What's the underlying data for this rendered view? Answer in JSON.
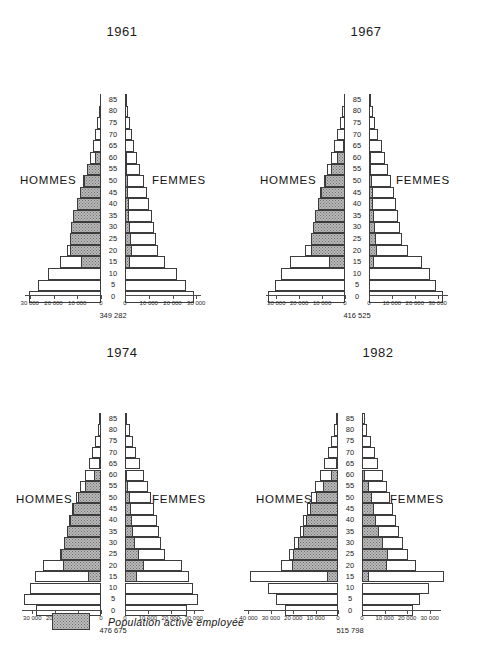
{
  "legend": {
    "label": "Population active employée",
    "swatch_name": "active-population-swatch",
    "fill_color": "#bdbdbd"
  },
  "labels": {
    "men": "HOMMES",
    "women": "FEMMES"
  },
  "age_ticks": [
    "0",
    "5",
    "10",
    "15",
    "20",
    "25",
    "30",
    "35",
    "40",
    "45",
    "50",
    "55",
    "60",
    "65",
    "70",
    "75",
    "80",
    "85"
  ],
  "chart_data": [
    {
      "type": "bar",
      "id": "pyramid-1961",
      "title": "1961",
      "total": "349 282",
      "xlabel": "",
      "ylabel": "",
      "orientation": "population-pyramid",
      "left_series_name": "HOMMES",
      "right_series_name": "FEMMES",
      "xlim": [
        0,
        32000
      ],
      "left_tick_labels": [
        "30 000",
        "20 000",
        "10 000",
        "0"
      ],
      "left_tick_values": [
        30000,
        20000,
        10000,
        0
      ],
      "right_tick_labels": [
        "0",
        "10 000",
        "20 000",
        "30 000"
      ],
      "right_tick_values": [
        0,
        10000,
        20000,
        30000
      ],
      "age_groups": [
        "0-4",
        "5-9",
        "10-14",
        "15-19",
        "20-24",
        "25-29",
        "30-34",
        "35-39",
        "40-44",
        "45-49",
        "50-54",
        "55-59",
        "60-64",
        "65-69",
        "70-74",
        "75-79",
        "80-84",
        "85+"
      ],
      "series": [
        {
          "name": "HOMMES total",
          "side": "left",
          "values": [
            30200,
            26500,
            22500,
            17300,
            14200,
            13200,
            12600,
            11700,
            10300,
            9000,
            7500,
            6100,
            4700,
            3500,
            2500,
            1600,
            900,
            400
          ]
        },
        {
          "name": "HOMMES active employée",
          "side": "left",
          "values": [
            0,
            0,
            0,
            8300,
            13000,
            13100,
            12500,
            11600,
            10200,
            8900,
            7300,
            5700,
            2500,
            600,
            0,
            0,
            0,
            0
          ]
        },
        {
          "name": "FEMMES total",
          "side": "right",
          "values": [
            29000,
            25800,
            21700,
            17000,
            14100,
            13000,
            12300,
            11400,
            10300,
            9100,
            7800,
            6500,
            5100,
            3900,
            2900,
            1900,
            1100,
            500
          ]
        },
        {
          "name": "FEMMES active employée",
          "side": "right",
          "values": [
            0,
            0,
            0,
            2100,
            2800,
            2600,
            2100,
            1800,
            1600,
            1400,
            1200,
            900,
            500,
            0,
            0,
            0,
            0,
            0
          ]
        }
      ]
    },
    {
      "type": "bar",
      "id": "pyramid-1967",
      "title": "1967",
      "total": "416 525",
      "xlabel": "",
      "ylabel": "",
      "orientation": "population-pyramid",
      "left_series_name": "HOMMES",
      "right_series_name": "FEMMES",
      "xlim": [
        0,
        34500
      ],
      "left_tick_labels": [
        "30 000",
        "20 000",
        "10 000",
        "0"
      ],
      "left_tick_values": [
        30000,
        20000,
        10000,
        0
      ],
      "right_tick_labels": [
        "0",
        "10 000",
        "20 000",
        "30 000"
      ],
      "right_tick_values": [
        0,
        10000,
        20000,
        30000
      ],
      "age_groups": [
        "0-4",
        "5-9",
        "10-14",
        "15-19",
        "20-24",
        "25-29",
        "30-34",
        "35-39",
        "40-44",
        "45-49",
        "50-54",
        "55-59",
        "60-64",
        "65-69",
        "70-74",
        "75-79",
        "80-84",
        "85+"
      ],
      "series": [
        {
          "name": "HOMMES total",
          "side": "left",
          "values": [
            33800,
            30500,
            28000,
            24000,
            17500,
            15000,
            14000,
            13000,
            12000,
            10700,
            9300,
            7800,
            6300,
            4800,
            3500,
            2300,
            1300,
            600
          ]
        },
        {
          "name": "HOMMES active employée",
          "side": "left",
          "values": [
            0,
            0,
            0,
            6800,
            14800,
            14800,
            13900,
            12900,
            11800,
            10400,
            8600,
            6300,
            3400,
            900,
            0,
            0,
            0,
            0
          ]
        },
        {
          "name": "FEMMES total",
          "side": "right",
          "values": [
            32200,
            29200,
            26800,
            23000,
            17200,
            14600,
            13600,
            12700,
            11900,
            10900,
            9700,
            8400,
            7000,
            5500,
            4100,
            2800,
            1700,
            800
          ]
        },
        {
          "name": "FEMMES active employée",
          "side": "right",
          "values": [
            0,
            0,
            0,
            2000,
            3300,
            3200,
            2700,
            2200,
            1900,
            1700,
            1400,
            1000,
            600,
            0,
            0,
            0,
            0,
            0
          ]
        }
      ]
    },
    {
      "type": "bar",
      "id": "pyramid-1974",
      "title": "1974",
      "total": "476 675",
      "xlabel": "",
      "ylabel": "",
      "orientation": "population-pyramid",
      "left_series_name": "HOMMES",
      "right_series_name": "FEMMES",
      "xlim": [
        0,
        34500
      ],
      "left_tick_labels": [
        "30 000",
        "20 000",
        "10 000",
        "0"
      ],
      "left_tick_values": [
        30000,
        20000,
        10000,
        0
      ],
      "right_tick_labels": [
        "0",
        "10 000",
        "20 000",
        "30 000"
      ],
      "right_tick_values": [
        0,
        10000,
        20000,
        30000
      ],
      "age_groups": [
        "0-4",
        "5-9",
        "10-14",
        "15-19",
        "20-24",
        "25-29",
        "30-34",
        "35-39",
        "40-44",
        "45-49",
        "50-54",
        "55-59",
        "60-64",
        "65-69",
        "70-74",
        "75-79",
        "80-84",
        "85+"
      ],
      "series": [
        {
          "name": "HOMMES total",
          "side": "left",
          "values": [
            28500,
            33500,
            31000,
            29000,
            25500,
            18000,
            16200,
            15000,
            13900,
            12600,
            11000,
            9100,
            7200,
            5400,
            3900,
            2600,
            1500,
            700
          ]
        },
        {
          "name": "HOMMES active employée",
          "side": "left",
          "values": [
            0,
            0,
            0,
            5500,
            16700,
            17400,
            16100,
            14900,
            13700,
            12200,
            9900,
            6900,
            3200,
            800,
            0,
            0,
            0,
            0
          ]
        },
        {
          "name": "FEMMES total",
          "side": "right",
          "values": [
            27200,
            32000,
            29800,
            28000,
            24800,
            17600,
            15800,
            14800,
            13800,
            12800,
            11500,
            10000,
            8200,
            6400,
            4800,
            3300,
            2000,
            1000
          ]
        },
        {
          "name": "FEMMES active employée",
          "side": "right",
          "values": [
            0,
            0,
            0,
            5200,
            8400,
            6100,
            4300,
            3600,
            3100,
            2700,
            2200,
            1500,
            800,
            0,
            0,
            0,
            0,
            0
          ]
        }
      ]
    },
    {
      "type": "bar",
      "id": "pyramid-1982",
      "title": "1982",
      "total": "515 798",
      "xlabel": "",
      "ylabel": "",
      "orientation": "population-pyramid",
      "left_series_name": "HOMMES",
      "right_series_name": "FEMMES",
      "xlim_left": [
        0,
        42000
      ],
      "xlim_right": [
        0,
        35000
      ],
      "left_tick_labels": [
        "40 000",
        "30 000",
        "20 000",
        "10 000",
        "0"
      ],
      "left_tick_values": [
        40000,
        30000,
        20000,
        10000,
        0
      ],
      "right_tick_labels": [
        "0",
        "10 000",
        "20 000",
        "30 000"
      ],
      "right_tick_values": [
        0,
        10000,
        20000,
        30000
      ],
      "age_groups": [
        "0-4",
        "5-9",
        "10-14",
        "15-19",
        "20-24",
        "25-29",
        "30-34",
        "35-39",
        "40-44",
        "45-49",
        "50-54",
        "55-59",
        "60-64",
        "65-69",
        "70-74",
        "75-79",
        "80-84",
        "85+"
      ],
      "series": [
        {
          "name": "HOMMES total",
          "side": "left",
          "values": [
            23500,
            27500,
            31500,
            39500,
            25500,
            22000,
            19500,
            17200,
            15500,
            14000,
            12200,
            10200,
            8200,
            6200,
            4500,
            3000,
            1800,
            900
          ]
        },
        {
          "name": "HOMMES active employée",
          "side": "left",
          "values": [
            0,
            0,
            0,
            5000,
            20500,
            20000,
            17800,
            15800,
            14200,
            12500,
            10000,
            6600,
            3000,
            700,
            0,
            0,
            0,
            0
          ]
        },
        {
          "name": "FEMMES total",
          "side": "right",
          "values": [
            22400,
            25500,
            29500,
            36500,
            24000,
            20500,
            18200,
            16400,
            15000,
            13800,
            12500,
            11000,
            9200,
            7300,
            5600,
            3900,
            2400,
            1200
          ]
        },
        {
          "name": "FEMMES active employée",
          "side": "right",
          "values": [
            0,
            0,
            0,
            3200,
            11200,
            11500,
            9500,
            7500,
            6200,
            5400,
            4300,
            2900,
            1400,
            0,
            0,
            0,
            0,
            0
          ]
        }
      ]
    }
  ]
}
